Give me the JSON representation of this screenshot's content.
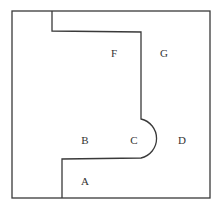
{
  "diagram": {
    "type": "floor-plan-regions",
    "stroke_color": "#3a3a3a",
    "background": "#ffffff",
    "outer_boundary": {
      "x": 12,
      "y": 11,
      "width": 198,
      "height": 187
    },
    "divider_path": "M52,11 L52,31 L141,32 L141,119 A20,20 0 0 1 141,158 L62,159 L62,198",
    "labels": [
      {
        "id": "F",
        "text": "F",
        "x": 114,
        "y": 57
      },
      {
        "id": "G",
        "text": "G",
        "x": 164,
        "y": 57
      },
      {
        "id": "B",
        "text": "B",
        "x": 85,
        "y": 144
      },
      {
        "id": "C",
        "text": "C",
        "x": 134,
        "y": 144
      },
      {
        "id": "D",
        "text": "D",
        "x": 182,
        "y": 144
      },
      {
        "id": "A",
        "text": "A",
        "x": 85,
        "y": 185
      }
    ]
  }
}
